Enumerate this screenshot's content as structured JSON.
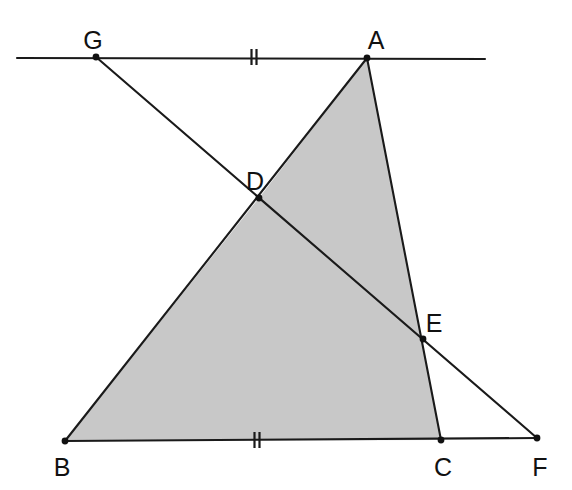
{
  "figure": {
    "background_color": "#ffffff",
    "line_color": "#1a1a1a",
    "label_color": "#111111",
    "shaded_fill_color": "#c8c8c8",
    "width": 572,
    "height": 490
  },
  "points": [
    {
      "id": "G",
      "label": "G",
      "x": 96,
      "y": 57,
      "label_x": 93,
      "label_y": 49
    },
    {
      "id": "A",
      "label": "A",
      "x": 367,
      "y": 58,
      "label_x": 376,
      "label_y": 49
    },
    {
      "id": "D",
      "label": "D",
      "x": 259,
      "y": 198,
      "label_x": 255,
      "label_y": 190
    },
    {
      "id": "E",
      "label": "E",
      "x": 423,
      "y": 339,
      "label_x": 434,
      "label_y": 332
    },
    {
      "id": "B",
      "label": "B",
      "x": 65,
      "y": 441,
      "label_x": 62,
      "label_y": 476
    },
    {
      "id": "C",
      "label": "C",
      "x": 441,
      "y": 440,
      "label_x": 443,
      "label_y": 476
    },
    {
      "id": "F",
      "label": "F",
      "x": 537,
      "y": 438,
      "label_x": 540,
      "label_y": 476
    }
  ],
  "segments": [
    {
      "id": "top-line",
      "name": "line-through-G-and-A",
      "x1": 17,
      "y1": 58,
      "x2": 485,
      "y2": 59
    },
    {
      "id": "bottom-line",
      "name": "line-B-to-F",
      "x1": 65,
      "y1": 441,
      "x2": 537,
      "y2": 438
    },
    {
      "id": "transversal",
      "name": "line-G-through-D-E-to-F",
      "x1": 96,
      "y1": 57,
      "x2": 537,
      "y2": 438
    },
    {
      "id": "side-AB",
      "name": "segment-A-through-D-to-B",
      "x1": 367,
      "y1": 58,
      "x2": 65,
      "y2": 441
    },
    {
      "id": "side-AC",
      "name": "segment-A-through-E-to-C",
      "x1": 367,
      "y1": 58,
      "x2": 441,
      "y2": 440
    }
  ],
  "shaded_region": {
    "name": "quadrilateral-A-D-B-C",
    "vertices": "367,58 259,198 65,441 441,440",
    "fill": "#c8c8c8"
  },
  "tick_marks": [
    {
      "id": "tick-GA",
      "name": "congruence-tick-on-segment-GA",
      "count": 2,
      "x": 254,
      "y": 57,
      "length": 16,
      "spacing": 5,
      "angle": 0
    },
    {
      "id": "tick-BC",
      "name": "congruence-tick-on-segment-BC",
      "count": 2,
      "x": 257,
      "y": 440,
      "length": 16,
      "spacing": 5,
      "angle": 0
    }
  ]
}
